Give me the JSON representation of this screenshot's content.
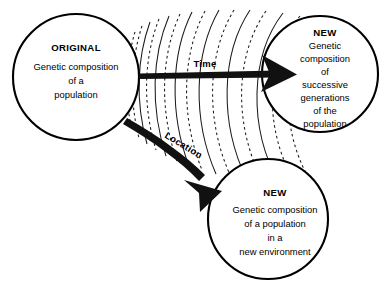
{
  "diagram": {
    "background_color": "#ffffff",
    "line_color": "#000000",
    "arrow_color": "#111111"
  },
  "nodes": {
    "original": {
      "heading": "ORIGINAL",
      "lines": [
        "Genetic composition",
        "of a",
        "population"
      ]
    },
    "new_time": {
      "heading": "NEW",
      "lines": [
        "Genetic",
        "composition",
        "of",
        "successive",
        "generations",
        "of the",
        "population"
      ]
    },
    "new_location": {
      "heading": "NEW",
      "lines": [
        "Genetic composition",
        "of a population",
        "in a",
        "new environment"
      ]
    }
  },
  "arrows": {
    "time": {
      "label": "Time"
    },
    "location": {
      "label": "Location"
    }
  },
  "fan": {
    "description": "concentric arcs radiating from the original population",
    "arc_count": 15,
    "pattern": [
      "dashed",
      "dashed",
      "solid",
      "dashed",
      "solid",
      "dashed",
      "solid",
      "dashed",
      "solid",
      "dashed",
      "solid",
      "dashed",
      "solid",
      "dashed",
      "dashed"
    ]
  }
}
